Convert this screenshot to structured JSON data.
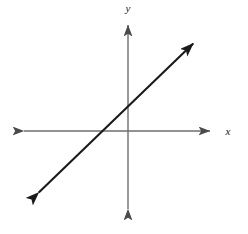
{
  "figure": {
    "kind": "cartesian-coordinate-plane",
    "background_color": "#ffffff",
    "width": 248,
    "height": 234
  },
  "axes": {
    "x_axis": {
      "label": "x",
      "color": "#6e6e6e",
      "stroke_width": 1.4,
      "arrowheads": "both",
      "screen_y": 131,
      "screen_x_start": 17,
      "screen_x_end": 216
    },
    "y_axis": {
      "label": "y",
      "color": "#6e6e6e",
      "stroke_width": 1.4,
      "arrowheads": "both",
      "screen_x": 128,
      "screen_y_start": 18,
      "screen_y_end": 216
    },
    "origin": {
      "screen_x": 128,
      "screen_y": 131
    },
    "ticks": [],
    "tick_labels": [],
    "gridlines": false
  },
  "labels": {
    "x_label": "x",
    "x_label_x": 228,
    "x_label_y": 135,
    "y_label": "y",
    "y_label_x": 128,
    "y_label_y": 12
  },
  "chart_data": {
    "type": "line",
    "title": "",
    "subtitle": "",
    "xlabel": "x",
    "ylabel": "y",
    "grid": false,
    "legend": "none",
    "annotations": [],
    "axis_style": "double-arrow-cartesian",
    "xlim": [
      -5.3,
      2.1
    ],
    "ylim": [
      -2.1,
      2.6
    ],
    "series": [
      {
        "name": "line",
        "color": "#1a1a1a",
        "stroke_width": 2.1,
        "arrowheads": "both",
        "slope": 0.96,
        "y_intercept": 0.92,
        "x_intercept": -0.96,
        "description": "straight line with positive slope near 1, rising left to right",
        "endpoints_screen": [
          {
            "x": 33,
            "y": 198
          },
          {
            "x": 199,
            "y": 38
          }
        ],
        "points": [
          {
            "x": -3.5,
            "y": -2.45
          },
          {
            "x": 2.6,
            "y": 3.4
          }
        ]
      }
    ]
  }
}
